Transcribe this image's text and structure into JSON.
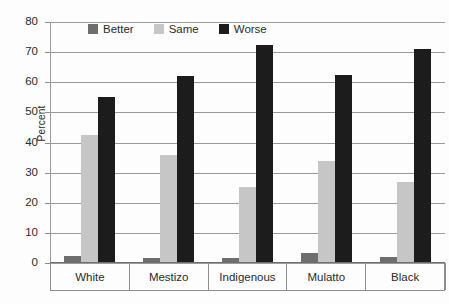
{
  "chart_data": {
    "type": "bar",
    "title": "",
    "xlabel": "",
    "ylabel": "Percent",
    "ylim": [
      0,
      80
    ],
    "yticks": [
      0,
      10,
      20,
      30,
      40,
      50,
      60,
      70,
      80
    ],
    "grid": true,
    "legend_position": "top-center",
    "categories": [
      "White",
      "Mestizo",
      "Indigenous",
      "Mulatto",
      "Black"
    ],
    "series": [
      {
        "name": "Better",
        "color": "#6e6e6e",
        "values": [
          2.3,
          1.8,
          1.8,
          3.3,
          2.1
        ]
      },
      {
        "name": "Same",
        "color": "#c6c6c6",
        "values": [
          42.5,
          36.0,
          25.3,
          34.0,
          27.0
        ]
      },
      {
        "name": "Worse",
        "color": "#1c1c1c",
        "values": [
          55.0,
          62.0,
          72.3,
          62.5,
          71.0
        ]
      }
    ]
  },
  "axis": {
    "y_title": "Percent",
    "y_tick_labels": [
      "80",
      "70",
      "60",
      "50",
      "40",
      "30",
      "20",
      "10",
      "0"
    ]
  },
  "legend": {
    "items": [
      {
        "label": "Better"
      },
      {
        "label": "Same"
      },
      {
        "label": "Worse"
      }
    ]
  }
}
